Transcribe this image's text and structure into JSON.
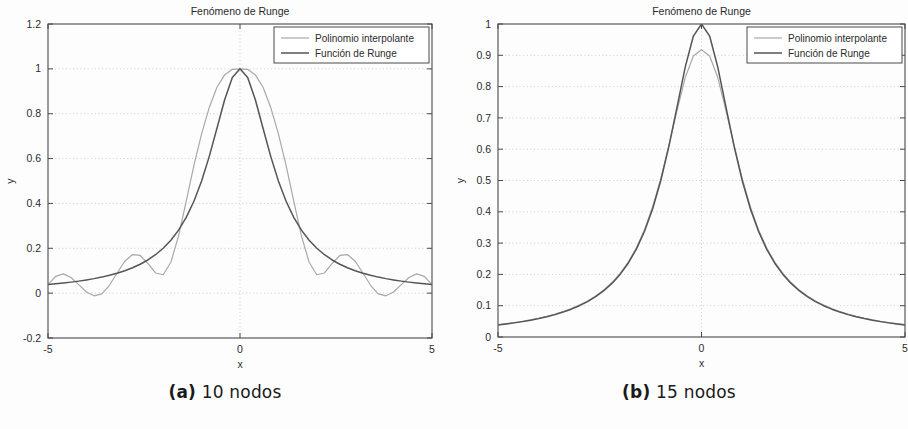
{
  "figure": {
    "panels": [
      {
        "id": "a",
        "caption_tag": "(a)",
        "caption_text": "10 nodos"
      },
      {
        "id": "b",
        "caption_tag": "(b)",
        "caption_text": "15 nodos"
      }
    ]
  },
  "colors": {
    "axis": "#4a4a4a",
    "grid": "#c9c9c9",
    "runge_curve": "#555555",
    "polynomial_curve": "#a8a8a8",
    "text": "#2b2b2b",
    "background": "#fdfdfd"
  },
  "chart_data": [
    {
      "type": "line",
      "panel": "a",
      "title": "Fenómeno de Runge",
      "xlabel": "x",
      "ylabel": "y",
      "xlim": [
        -5,
        5
      ],
      "ylim": [
        -0.2,
        1.2
      ],
      "xticks": [
        -5,
        0,
        5
      ],
      "xticklabels": [
        "-5",
        "0",
        "5"
      ],
      "yticks": [
        -0.2,
        0,
        0.2,
        0.4,
        0.6,
        0.8,
        1,
        1.2
      ],
      "yticklabels": [
        "-0.2",
        "0",
        "0.2",
        "0.4",
        "0.6",
        "0.8",
        "1",
        "1.2"
      ],
      "grid": true,
      "legend_position": "top-right",
      "nodes": 10,
      "series": [
        {
          "name": "Polinomio interpolante",
          "color": "#a8a8a8",
          "x": [
            -5.0,
            -4.8,
            -4.6,
            -4.4,
            -4.2,
            -4.0,
            -3.8,
            -3.6,
            -3.4,
            -3.2,
            -3.0,
            -2.8,
            -2.6,
            -2.4,
            -2.2,
            -2.0,
            -1.8,
            -1.6,
            -1.4,
            -1.2,
            -1.0,
            -0.8,
            -0.6,
            -0.4,
            -0.2,
            0.0,
            0.2,
            0.4,
            0.6,
            0.8,
            1.0,
            1.2,
            1.4,
            1.6,
            1.8,
            2.0,
            2.2,
            2.4,
            2.6,
            2.8,
            3.0,
            3.2,
            3.4,
            3.6,
            3.8,
            4.0,
            4.2,
            4.4,
            4.6,
            4.8,
            5.0
          ],
          "y": [
            0.038,
            0.075,
            0.086,
            0.07,
            0.038,
            0.005,
            -0.012,
            -0.003,
            0.035,
            0.09,
            0.142,
            0.172,
            0.168,
            0.133,
            0.09,
            0.082,
            0.138,
            0.255,
            0.41,
            0.57,
            0.71,
            0.828,
            0.918,
            0.973,
            0.998,
            1.0,
            0.998,
            0.973,
            0.918,
            0.828,
            0.71,
            0.57,
            0.41,
            0.255,
            0.138,
            0.082,
            0.09,
            0.133,
            0.168,
            0.172,
            0.142,
            0.09,
            0.035,
            -0.003,
            -0.012,
            0.005,
            0.038,
            0.07,
            0.086,
            0.075,
            0.038
          ]
        },
        {
          "name": "Función de Runge",
          "color": "#555555",
          "x": [
            -5.0,
            -4.8,
            -4.6,
            -4.4,
            -4.2,
            -4.0,
            -3.8,
            -3.6,
            -3.4,
            -3.2,
            -3.0,
            -2.8,
            -2.6,
            -2.4,
            -2.2,
            -2.0,
            -1.8,
            -1.6,
            -1.4,
            -1.2,
            -1.0,
            -0.8,
            -0.6,
            -0.4,
            -0.2,
            0.0,
            0.2,
            0.4,
            0.6,
            0.8,
            1.0,
            1.2,
            1.4,
            1.6,
            1.8,
            2.0,
            2.2,
            2.4,
            2.6,
            2.8,
            3.0,
            3.2,
            3.4,
            3.6,
            3.8,
            4.0,
            4.2,
            4.4,
            4.6,
            4.8,
            5.0
          ],
          "y": [
            0.0385,
            0.0416,
            0.0451,
            0.0491,
            0.0536,
            0.0588,
            0.0647,
            0.0715,
            0.0796,
            0.0889,
            0.1,
            0.1131,
            0.1288,
            0.1479,
            0.1713,
            0.2,
            0.2358,
            0.2809,
            0.3378,
            0.4098,
            0.5,
            0.6098,
            0.7353,
            0.8621,
            0.9615,
            1.0,
            0.9615,
            0.8621,
            0.7353,
            0.6098,
            0.5,
            0.4098,
            0.3378,
            0.2809,
            0.2358,
            0.2,
            0.1713,
            0.1479,
            0.1288,
            0.1131,
            0.1,
            0.0889,
            0.0796,
            0.0715,
            0.0647,
            0.0588,
            0.0536,
            0.0491,
            0.0451,
            0.0416,
            0.0385
          ]
        }
      ]
    },
    {
      "type": "line",
      "panel": "b",
      "title": "Fenómeno de Runge",
      "xlabel": "x",
      "ylabel": "y",
      "xlim": [
        -5,
        5
      ],
      "ylim": [
        0,
        1
      ],
      "xticks": [
        -5,
        0,
        5
      ],
      "xticklabels": [
        "-5",
        "0",
        "5"
      ],
      "yticks": [
        0,
        0.1,
        0.2,
        0.3,
        0.4,
        0.5,
        0.6,
        0.7,
        0.8,
        0.9,
        1
      ],
      "yticklabels": [
        "0",
        "0.1",
        "0.2",
        "0.3",
        "0.4",
        "0.5",
        "0.6",
        "0.7",
        "0.8",
        "0.9",
        "1"
      ],
      "grid": true,
      "legend_position": "top-right",
      "nodes": 15,
      "series": [
        {
          "name": "Polinomio interpolante",
          "color": "#a8a8a8",
          "x": [
            -5.0,
            -4.8,
            -4.6,
            -4.4,
            -4.2,
            -4.0,
            -3.8,
            -3.6,
            -3.4,
            -3.2,
            -3.0,
            -2.8,
            -2.6,
            -2.4,
            -2.2,
            -2.0,
            -1.8,
            -1.6,
            -1.4,
            -1.2,
            -1.0,
            -0.8,
            -0.6,
            -0.4,
            -0.2,
            0.0,
            0.2,
            0.4,
            0.6,
            0.8,
            1.0,
            1.2,
            1.4,
            1.6,
            1.8,
            2.0,
            2.2,
            2.4,
            2.6,
            2.8,
            3.0,
            3.2,
            3.4,
            3.6,
            3.8,
            4.0,
            4.2,
            4.4,
            4.6,
            4.8,
            5.0
          ],
          "y": [
            0.04,
            0.043,
            0.046,
            0.05,
            0.055,
            0.06,
            0.066,
            0.073,
            0.081,
            0.091,
            0.102,
            0.115,
            0.131,
            0.15,
            0.174,
            0.203,
            0.239,
            0.285,
            0.343,
            0.416,
            0.506,
            0.613,
            0.724,
            0.829,
            0.898,
            0.918,
            0.898,
            0.829,
            0.724,
            0.613,
            0.506,
            0.416,
            0.343,
            0.285,
            0.239,
            0.203,
            0.174,
            0.15,
            0.131,
            0.115,
            0.102,
            0.091,
            0.081,
            0.073,
            0.066,
            0.06,
            0.055,
            0.05,
            0.046,
            0.043,
            0.04
          ]
        },
        {
          "name": "Función de Runge",
          "color": "#555555",
          "x": [
            -5.0,
            -4.8,
            -4.6,
            -4.4,
            -4.2,
            -4.0,
            -3.8,
            -3.6,
            -3.4,
            -3.2,
            -3.0,
            -2.8,
            -2.6,
            -2.4,
            -2.2,
            -2.0,
            -1.8,
            -1.6,
            -1.4,
            -1.2,
            -1.0,
            -0.8,
            -0.6,
            -0.4,
            -0.2,
            0.0,
            0.2,
            0.4,
            0.6,
            0.8,
            1.0,
            1.2,
            1.4,
            1.6,
            1.8,
            2.0,
            2.2,
            2.4,
            2.6,
            2.8,
            3.0,
            3.2,
            3.4,
            3.6,
            3.8,
            4.0,
            4.2,
            4.4,
            4.6,
            4.8,
            5.0
          ],
          "y": [
            0.0385,
            0.0416,
            0.0451,
            0.0491,
            0.0536,
            0.0588,
            0.0647,
            0.0715,
            0.0796,
            0.0889,
            0.1,
            0.1131,
            0.1288,
            0.1479,
            0.1713,
            0.2,
            0.2358,
            0.2809,
            0.3378,
            0.4098,
            0.5,
            0.6098,
            0.7353,
            0.8621,
            0.9615,
            1.0,
            0.9615,
            0.8621,
            0.7353,
            0.6098,
            0.5,
            0.4098,
            0.3378,
            0.2809,
            0.2358,
            0.2,
            0.1713,
            0.1479,
            0.1288,
            0.1131,
            0.1,
            0.0889,
            0.0796,
            0.0715,
            0.0647,
            0.0588,
            0.0536,
            0.0491,
            0.0451,
            0.0416,
            0.0385
          ]
        }
      ]
    }
  ]
}
